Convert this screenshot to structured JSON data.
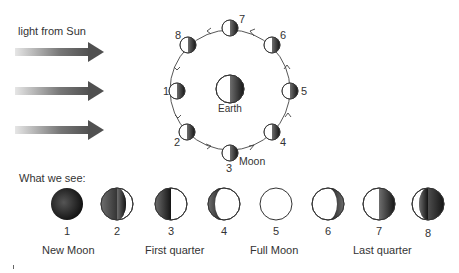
{
  "diagram": {
    "sun_label": "light from Sun",
    "earth_label": "Earth",
    "moon_label": "Moon",
    "what_we_see_label": "What we see:",
    "orbit_positions": [
      {
        "n": "1",
        "x": 177,
        "y": 91,
        "label_x": 164,
        "label_y": 85
      },
      {
        "n": "2",
        "x": 191,
        "y": 132,
        "label_x": 175,
        "label_y": 137
      },
      {
        "n": "3",
        "x": 230,
        "y": 152,
        "label_x": 226,
        "label_y": 163
      },
      {
        "n": "4",
        "x": 269,
        "y": 130,
        "label_x": 280,
        "label_y": 137
      },
      {
        "n": "5",
        "x": 290,
        "y": 91,
        "label_x": 301,
        "label_y": 85
      },
      {
        "n": "6",
        "x": 274,
        "y": 45,
        "label_x": 280,
        "label_y": 29
      },
      {
        "n": "7",
        "x": 230,
        "y": 27,
        "label_x": 240,
        "label_y": 13
      },
      {
        "n": "8",
        "x": 187,
        "y": 45,
        "label_x": 175,
        "label_y": 29
      }
    ],
    "phases": [
      {
        "n": "1",
        "x": 67,
        "type": "new"
      },
      {
        "n": "2",
        "x": 117,
        "type": "waxing-crescent"
      },
      {
        "n": "3",
        "x": 171,
        "type": "first-quarter"
      },
      {
        "n": "4",
        "x": 224,
        "type": "waxing-gibbous"
      },
      {
        "n": "5",
        "x": 276,
        "type": "full"
      },
      {
        "n": "6",
        "x": 328,
        "type": "waning-gibbous"
      },
      {
        "n": "7",
        "x": 379,
        "type": "last-quarter"
      },
      {
        "n": "8",
        "x": 428,
        "type": "waning-crescent"
      }
    ],
    "phase_names": [
      {
        "label": "New Moon",
        "x": 42
      },
      {
        "label": "First quarter",
        "x": 145
      },
      {
        "label": "Full Moon",
        "x": 250
      },
      {
        "label": "Last quarter",
        "x": 353
      }
    ],
    "colors": {
      "dark": "#1e1e1e",
      "mid": "#555555",
      "line": "#444444",
      "arrow": "#5a5a5a"
    }
  }
}
